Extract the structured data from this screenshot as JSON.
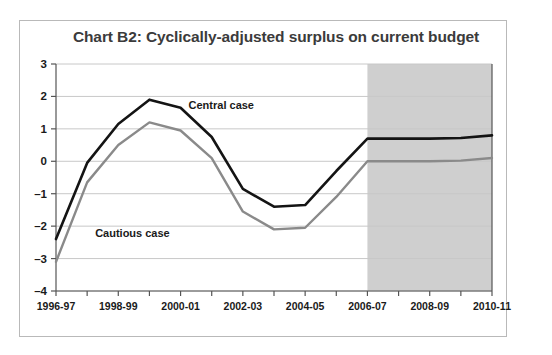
{
  "chart_data": {
    "type": "line",
    "title": "Chart B2: Cyclically-adjusted surplus on current budget",
    "xlabel": "",
    "ylabel": "",
    "ylim": [
      -4,
      3
    ],
    "yticks": [
      3,
      2,
      1,
      0,
      -1,
      -2,
      -3,
      -4
    ],
    "ytick_labels": [
      "3",
      "2",
      "1",
      "0",
      "–1",
      "–2",
      "–3",
      "–4"
    ],
    "grid": true,
    "legend_position": "inline-annotations",
    "x": [
      "1996-97",
      "1997-98",
      "1998-99",
      "1999-00",
      "2000-01",
      "2001-02",
      "2002-03",
      "2003-04",
      "2004-05",
      "2005-06",
      "2006-07",
      "2007-08",
      "2008-09",
      "2009-10",
      "2010-11"
    ],
    "xtick_labels": [
      "1996-97",
      "1998-99",
      "2000-01",
      "2002-03",
      "2004-05",
      "2006-07",
      "2008-09",
      "2010-11"
    ],
    "xtick_label_every": 2,
    "series": [
      {
        "name": "Central case",
        "color": "#141414",
        "values": [
          -2.4,
          -0.05,
          1.15,
          1.9,
          1.65,
          0.75,
          -0.85,
          -1.4,
          -1.35,
          -0.3,
          0.7,
          0.7,
          0.7,
          0.72,
          0.8
        ]
      },
      {
        "name": "Cautious case",
        "color": "#8a8a8a",
        "values": [
          -3.1,
          -0.65,
          0.5,
          1.2,
          0.95,
          0.1,
          -1.55,
          -2.1,
          -2.05,
          -1.1,
          0.0,
          0.0,
          0.0,
          0.02,
          0.1
        ]
      }
    ],
    "annotations": [
      {
        "text": "Central case",
        "x": "2000-01",
        "y": 1.6
      },
      {
        "text": "Cautious case",
        "x": "1997-98",
        "y": -2.35
      }
    ],
    "shaded_region": {
      "label": "forecast",
      "start": "2006-07",
      "end": "2010-11",
      "color": "#cfcfcf"
    },
    "colors": {
      "gridline": "#c8c8c8",
      "axis": "#555555",
      "title": "#3b3b3b",
      "frame": "#b9b9b9",
      "background": "#ffffff"
    }
  }
}
